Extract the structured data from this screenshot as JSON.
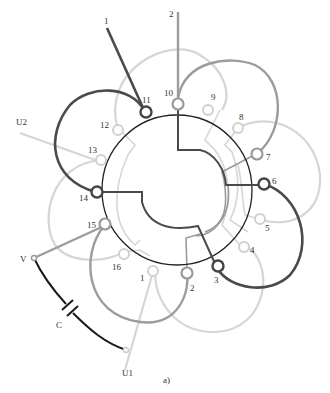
{
  "diagram": {
    "caption": "a)",
    "colors": {
      "dark": "#4a4a4a",
      "medium": "#9a9a9a",
      "light": "#d4d4d4",
      "black": "#1a1a1a",
      "rotor_circle": "#222222"
    },
    "terminal_labels": {
      "t1": "1",
      "t2": "2",
      "t3": "3",
      "t4": "4",
      "t5": "5",
      "t6": "6",
      "t7": "7",
      "t8": "8",
      "t9": "9",
      "t10": "10",
      "t11": "11",
      "t12": "12",
      "t13": "13",
      "t14": "14",
      "t15": "15",
      "t16": "16"
    },
    "lead_labels": {
      "lead_1": "1",
      "lead_2": "2",
      "u1": "U1",
      "u2": "U2",
      "v": "V"
    },
    "capacitor_label": "C"
  }
}
